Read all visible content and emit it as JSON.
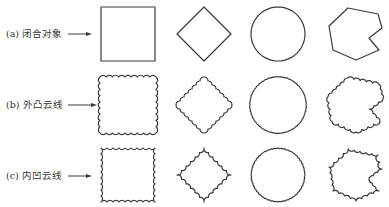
{
  "figure": {
    "rows": [
      {
        "id": "a",
        "label": "(a) 闭合对象",
        "style": "plain",
        "center_y": 34
      },
      {
        "id": "b",
        "label": "(b) 外凸云线",
        "style": "convex-cloud",
        "center_y": 105
      },
      {
        "id": "c",
        "label": "(c) 内凹云线",
        "style": "concave-cloud",
        "center_y": 175
      }
    ],
    "shapes": [
      "square",
      "diamond",
      "circle",
      "irregular-polygon"
    ],
    "colors": {
      "stroke": "#3a3a3a",
      "text": "#333333",
      "background": "#ffffff"
    }
  }
}
